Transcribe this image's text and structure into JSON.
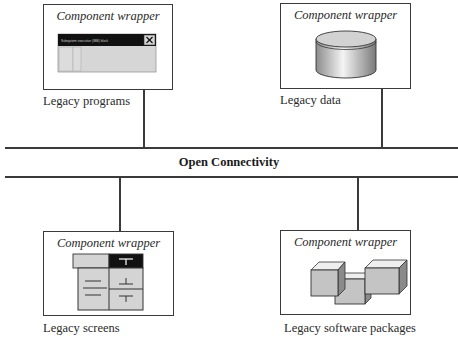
{
  "diagram": {
    "bus": {
      "label": "Open Connectivity"
    },
    "components": [
      {
        "wrapper_label": "Component wrapper",
        "caption": "Legacy programs",
        "icon": "window-dialog-icon",
        "window_title_text": "Subsystem executive (IBM) block"
      },
      {
        "wrapper_label": "Component wrapper",
        "caption": "Legacy data",
        "icon": "database-cylinder-icon"
      },
      {
        "wrapper_label": "Component wrapper",
        "caption": "Legacy screens",
        "icon": "screen-form-icon"
      },
      {
        "wrapper_label": "Component wrapper",
        "caption": "Legacy software packages",
        "icon": "package-cubes-icon"
      }
    ]
  },
  "colors": {
    "line": "#3a3a3a",
    "fill_gray": "#d4d4d4",
    "titlebar": "#111111"
  }
}
